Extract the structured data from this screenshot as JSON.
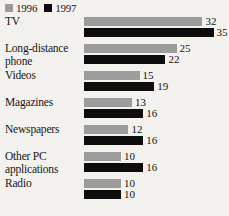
{
  "legend": {
    "entries": [
      {
        "label": "1996",
        "color": "#9c9c9c"
      },
      {
        "label": "1997",
        "color": "#0d0d0d"
      }
    ]
  },
  "chart_data": {
    "type": "bar",
    "title": "",
    "subtitle": "",
    "xlabel": "",
    "ylabel": "",
    "orientation": "horizontal",
    "grid": false,
    "legend_position": "top-left",
    "xlim": [
      0,
      35
    ],
    "categories": [
      "TV",
      "Long-distance phone",
      "Videos",
      "Magazines",
      "Newspapers",
      "Other PC applications",
      "Radio"
    ],
    "series": [
      {
        "name": "1996",
        "color": "#9c9c9c",
        "values": [
          32,
          25,
          15,
          13,
          12,
          10,
          10
        ]
      },
      {
        "name": "1997",
        "color": "#0d0d0d",
        "values": [
          35,
          22,
          19,
          16,
          16,
          16,
          10
        ]
      }
    ]
  },
  "rows": [
    {
      "label_line1": "TV",
      "label_line2": "",
      "v1996": 32,
      "v1997": 35,
      "v1996_text": "32",
      "v1997_text": "35"
    },
    {
      "label_line1": "Long-distance",
      "label_line2": "phone",
      "v1996": 25,
      "v1997": 22,
      "v1996_text": "25",
      "v1997_text": "22"
    },
    {
      "label_line1": "Videos",
      "label_line2": "",
      "v1996": 15,
      "v1997": 19,
      "v1996_text": "15",
      "v1997_text": "19"
    },
    {
      "label_line1": "Magazines",
      "label_line2": "",
      "v1996": 13,
      "v1997": 16,
      "v1996_text": "13",
      "v1997_text": "16"
    },
    {
      "label_line1": "Newspapers",
      "label_line2": "",
      "v1996": 12,
      "v1997": 16,
      "v1996_text": "12",
      "v1997_text": "16"
    },
    {
      "label_line1": "Other PC",
      "label_line2": "applications",
      "v1996": 10,
      "v1997": 16,
      "v1996_text": "10",
      "v1997_text": "16"
    },
    {
      "label_line1": "Radio",
      "label_line2": "",
      "v1996": 10,
      "v1997": 10,
      "v1996_text": "10",
      "v1997_text": "10"
    }
  ],
  "scale": {
    "px_per_unit": 3.7
  }
}
